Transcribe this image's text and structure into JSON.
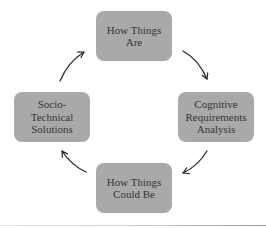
{
  "diagram": {
    "type": "cycle",
    "nodes": [
      {
        "id": "top",
        "label": "How Things\nAre"
      },
      {
        "id": "right",
        "label": "Cognitive\nRequirements\nAnalysis"
      },
      {
        "id": "bottom",
        "label": "How Things\nCould Be"
      },
      {
        "id": "left",
        "label": "Socio-\nTechnical\nSolutions"
      }
    ],
    "edges": [
      {
        "from": "top",
        "to": "right"
      },
      {
        "from": "right",
        "to": "bottom"
      },
      {
        "from": "bottom",
        "to": "left"
      },
      {
        "from": "left",
        "to": "top"
      }
    ],
    "colors": {
      "node_fill": "#a9a9a9",
      "node_text": "#353535",
      "arrow": "#2b2b2b"
    }
  }
}
